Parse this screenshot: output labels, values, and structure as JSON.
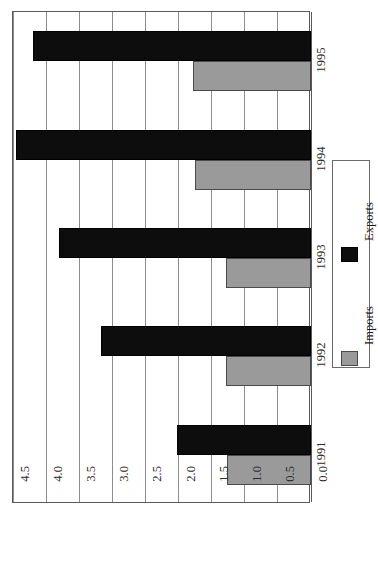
{
  "chart_data": {
    "type": "bar",
    "orientation": "horizontal-rotated",
    "title": "",
    "xlabel": "",
    "ylabel": "",
    "categories": [
      "1991",
      "1992",
      "1993",
      "1994",
      "1995"
    ],
    "series": [
      {
        "name": "Imports",
        "color": "#9a9a9a",
        "values": [
          1.27,
          1.28,
          1.28,
          1.75,
          1.78
        ]
      },
      {
        "name": "Exports",
        "color": "#0d0d0d",
        "values": [
          2.02,
          3.17,
          3.8,
          4.45,
          4.2
        ]
      }
    ],
    "value_axis": {
      "min": 0.0,
      "max": 4.5,
      "tick_step": 0.5,
      "ticks": [
        "0.0",
        "0.5",
        "1.0",
        "1.5",
        "2.0",
        "2.5",
        "3.0",
        "3.5",
        "4.0",
        "4.5"
      ],
      "direction": "right-to-left"
    },
    "grid": true,
    "legend": {
      "position": "right",
      "entries": [
        {
          "label": "Imports",
          "color": "#9a9a9a"
        },
        {
          "label": "Exports",
          "color": "#0d0d0d"
        }
      ]
    },
    "plot_background": "#ffffff",
    "border_color": "#5a5a5a",
    "gridline_color": "#8d8d8d"
  }
}
